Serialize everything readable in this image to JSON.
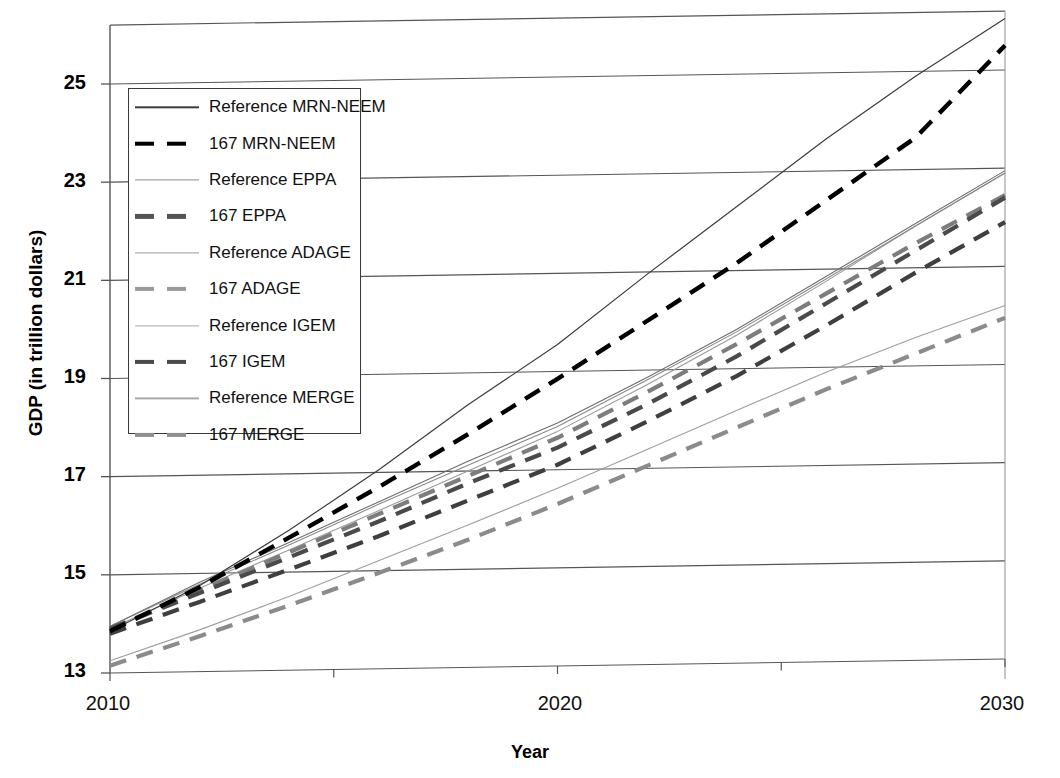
{
  "chart_data": {
    "type": "line",
    "title": "",
    "xlabel": "Year",
    "ylabel": "GDP (in trillion dollars)",
    "xlim": [
      2010,
      2030
    ],
    "ylim": [
      13,
      26.2
    ],
    "xticks": [
      "2010",
      "2020",
      "2030"
    ],
    "yticks": [
      "13",
      "15",
      "17",
      "19",
      "21",
      "23",
      "25"
    ],
    "grid": "horizontal",
    "legend_position": "upper-left-inside",
    "x": [
      2010,
      2012,
      2014,
      2016,
      2018,
      2020,
      2022,
      2024,
      2026,
      2028,
      2030
    ],
    "series": [
      {
        "name": "Reference MRN-NEEM",
        "style": "solid",
        "color": "#3b3b3b",
        "width": 1.2,
        "values": [
          13.85,
          14.75,
          15.85,
          17.05,
          18.35,
          19.55,
          20.95,
          22.3,
          23.65,
          24.9,
          26.05
        ]
      },
      {
        "name": "167 MRN-NEEM",
        "style": "dashed",
        "color": "#000000",
        "width": 4.4,
        "values": [
          13.85,
          14.72,
          15.7,
          16.7,
          17.75,
          18.85,
          20.0,
          21.15,
          22.4,
          23.65,
          25.5
        ]
      },
      {
        "name": "Reference EPPA",
        "style": "solid",
        "color": "#6e6e6e",
        "width": 1.1,
        "values": [
          13.95,
          14.82,
          15.6,
          16.4,
          17.2,
          17.95,
          18.85,
          19.8,
          20.85,
          21.9,
          22.95
        ]
      },
      {
        "name": "167 EPPA",
        "style": "dashed",
        "color": "#4a4a4a",
        "width": 4.2,
        "values": [
          13.9,
          14.6,
          15.3,
          16.0,
          16.75,
          17.45,
          18.3,
          19.25,
          20.3,
          21.35,
          22.4
        ]
      },
      {
        "name": "Reference ADAGE",
        "style": "solid",
        "color": "#8a8a8a",
        "width": 1.1,
        "values": [
          13.95,
          14.78,
          15.55,
          16.35,
          17.12,
          17.88,
          18.8,
          19.75,
          20.8,
          21.85,
          22.9
        ]
      },
      {
        "name": "167 ADAGE",
        "style": "dashed",
        "color": "#7d7d7d",
        "width": 4.2,
        "values": [
          13.9,
          14.65,
          15.4,
          16.15,
          16.9,
          17.65,
          18.55,
          19.5,
          20.5,
          21.5,
          22.45
        ]
      },
      {
        "name": "Reference IGEM",
        "style": "solid",
        "color": "#9a9a9a",
        "width": 1.1,
        "values": [
          13.9,
          14.7,
          15.45,
          16.22,
          17.0,
          17.78,
          18.7,
          19.68,
          20.75,
          21.85,
          22.9
        ]
      },
      {
        "name": "167 IGEM",
        "style": "dashed",
        "color": "#3f3f3f",
        "width": 4.2,
        "values": [
          13.8,
          14.42,
          15.05,
          15.7,
          16.4,
          17.1,
          17.95,
          18.85,
          19.85,
          20.9,
          21.9
        ]
      },
      {
        "name": "Reference MERGE",
        "style": "solid",
        "color": "#9e9e9e",
        "width": 1.1,
        "values": [
          13.25,
          13.85,
          14.5,
          15.2,
          15.9,
          16.62,
          17.38,
          18.15,
          18.9,
          19.58,
          20.2
        ]
      },
      {
        "name": "167 MERGE",
        "style": "dashed",
        "color": "#8b8b8b",
        "width": 4.2,
        "values": [
          13.15,
          13.72,
          14.32,
          14.95,
          15.6,
          16.3,
          17.05,
          17.8,
          18.55,
          19.25,
          19.95
        ]
      }
    ]
  },
  "axes": {
    "y_label": "GDP (in trillion dollars)",
    "x_label": "Year",
    "y_ticks": [
      "25",
      "23",
      "21",
      "19",
      "17",
      "15",
      "13"
    ],
    "x_ticks": [
      "2010",
      "2020",
      "2030"
    ]
  },
  "legend": {
    "items": [
      {
        "label": "Reference MRN-NEEM",
        "style": "solid",
        "color": "#3b3b3b",
        "width": 1.4
      },
      {
        "label": "167 MRN-NEEM",
        "style": "dashed",
        "color": "#000000",
        "width": 4.6
      },
      {
        "label": "Reference EPPA",
        "style": "solid",
        "color": "#8c8c8c",
        "width": 1.2
      },
      {
        "label": "167 EPPA",
        "style": "dashed",
        "color": "#555555",
        "width": 4.2
      },
      {
        "label": "Reference ADAGE",
        "style": "solid",
        "color": "#9a9a9a",
        "width": 1.2
      },
      {
        "label": "167 ADAGE",
        "style": "dashed",
        "color": "#9a9a9a",
        "width": 4.2
      },
      {
        "label": "Reference IGEM",
        "style": "solid",
        "color": "#a8a8a8",
        "width": 1.2
      },
      {
        "label": "167 IGEM",
        "style": "dashed",
        "color": "#4a4a4a",
        "width": 4.2
      },
      {
        "label": "Reference MERGE",
        "style": "solid",
        "color": "#a8a8a8",
        "width": 1.2
      },
      {
        "label": "167 MERGE",
        "style": "dashed",
        "color": "#8f8f8f",
        "width": 4.2
      }
    ]
  }
}
